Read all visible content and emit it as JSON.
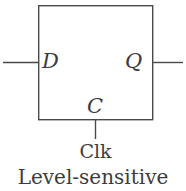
{
  "figure": {
    "kind": "logic-symbol",
    "component": "D latch",
    "caption_clock": "Clk",
    "caption_type": "Level-sensitive",
    "ports": {
      "data_input": "D",
      "data_output": "Q",
      "clock_input": "C"
    },
    "colors": {
      "stroke": "#4a4a4a",
      "text": "#3c3c3c",
      "background": "#ffffff"
    },
    "geometry": {
      "box": {
        "x": 38,
        "y": 5,
        "width": 115,
        "height": 115
      },
      "input_wire": {
        "x1": 3,
        "y1": 62,
        "x2": 38,
        "y2": 62
      },
      "output_wire": {
        "x1": 153,
        "y1": 62,
        "x2": 183,
        "y2": 62
      },
      "clock_wire": {
        "x1": 95,
        "y1": 120,
        "x2": 95,
        "y2": 139
      },
      "stroke_width": 1.4
    }
  }
}
